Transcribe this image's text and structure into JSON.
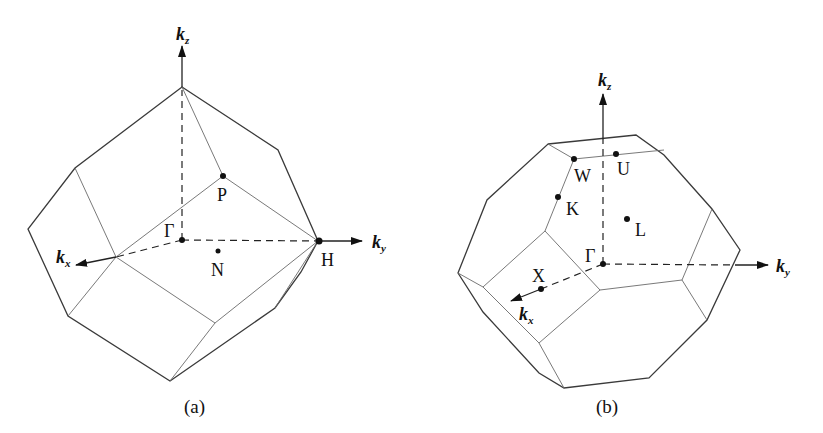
{
  "figure_a": {
    "caption": "(a)",
    "axes": {
      "kz": {
        "base": "k",
        "sub": "z"
      },
      "ky": {
        "base": "k",
        "sub": "y"
      },
      "kx": {
        "base": "k",
        "sub": "x"
      }
    },
    "points": {
      "gamma": "Γ",
      "P": "P",
      "N": "N",
      "H": "H"
    }
  },
  "figure_b": {
    "caption": "(b)",
    "axes": {
      "kz": {
        "base": "k",
        "sub": "z"
      },
      "ky": {
        "base": "k",
        "sub": "y"
      },
      "kx": {
        "base": "k",
        "sub": "x"
      }
    },
    "points": {
      "gamma": "Γ",
      "W": "W",
      "U": "U",
      "K": "K",
      "L": "L",
      "X": "X"
    }
  }
}
